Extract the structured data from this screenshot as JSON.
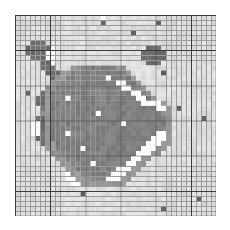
{
  "chart_data": {
    "type": "heatmap",
    "title": "",
    "subtitle": "",
    "xlabel": "",
    "ylabel": "",
    "legend": [],
    "annotations": [],
    "grid": true,
    "grid_minor_color": "#9a9a9a",
    "grid_major_color": "#3c3c3c",
    "grid_major_every": 7,
    "colormap": "gray",
    "colormap_reversed": true,
    "vmin": 0,
    "vmax": 255,
    "nrows": 40,
    "ncols": 40,
    "xlim": [
      0,
      40
    ],
    "ylim": [
      0,
      40
    ],
    "xticks": [],
    "yticks": [],
    "xticklabels": [],
    "yticklabels": [],
    "value_levels": {
      "white": 252,
      "light": 222,
      "mid_light": 196,
      "mid": 150,
      "dark": 128,
      "darker": 110,
      "very_dark": 96
    },
    "palette": [
      "#fcfcfc",
      "#dedede",
      "#c4c4c4",
      "#969696",
      "#808080",
      "#6e6e6e",
      "#606060"
    ],
    "values": [
      [
        1,
        1,
        1,
        1,
        1,
        1,
        1,
        1,
        1,
        1,
        1,
        1,
        1,
        1,
        1,
        1,
        1,
        0,
        1,
        1,
        1,
        1,
        1,
        1,
        1,
        1,
        1,
        1,
        1,
        1,
        1,
        1,
        1,
        1,
        1,
        1,
        1,
        1,
        1,
        1
      ],
      [
        1,
        1,
        1,
        1,
        1,
        1,
        1,
        1,
        1,
        1,
        1,
        1,
        1,
        1,
        1,
        1,
        1,
        6,
        1,
        1,
        1,
        1,
        1,
        1,
        1,
        1,
        1,
        1,
        6,
        1,
        1,
        1,
        1,
        1,
        1,
        1,
        1,
        1,
        1,
        1
      ],
      [
        1,
        1,
        1,
        1,
        1,
        1,
        1,
        1,
        1,
        1,
        1,
        1,
        1,
        1,
        1,
        1,
        1,
        1,
        1,
        1,
        1,
        1,
        1,
        1,
        1,
        1,
        1,
        1,
        1,
        1,
        1,
        1,
        1,
        1,
        1,
        1,
        1,
        1,
        1,
        1
      ],
      [
        1,
        1,
        1,
        1,
        1,
        1,
        1,
        1,
        1,
        1,
        1,
        1,
        1,
        1,
        1,
        1,
        1,
        1,
        1,
        1,
        1,
        1,
        1,
        6,
        1,
        1,
        1,
        1,
        1,
        1,
        1,
        1,
        1,
        1,
        1,
        1,
        1,
        1,
        1,
        1
      ],
      [
        1,
        1,
        1,
        1,
        1,
        1,
        1,
        1,
        1,
        1,
        1,
        1,
        1,
        1,
        1,
        1,
        1,
        1,
        1,
        1,
        1,
        1,
        1,
        1,
        1,
        1,
        1,
        1,
        1,
        1,
        1,
        1,
        1,
        1,
        1,
        1,
        1,
        1,
        1,
        1
      ],
      [
        1,
        1,
        1,
        5,
        5,
        5,
        1,
        1,
        1,
        1,
        1,
        1,
        1,
        1,
        1,
        1,
        1,
        1,
        1,
        1,
        1,
        1,
        1,
        1,
        1,
        1,
        1,
        1,
        1,
        1,
        1,
        1,
        1,
        1,
        1,
        1,
        1,
        1,
        1,
        1
      ],
      [
        1,
        1,
        5,
        5,
        5,
        5,
        5,
        0,
        1,
        1,
        1,
        1,
        1,
        1,
        1,
        1,
        1,
        1,
        1,
        1,
        1,
        1,
        1,
        1,
        1,
        1,
        5,
        5,
        5,
        1,
        1,
        1,
        1,
        1,
        1,
        1,
        1,
        1,
        1,
        1
      ],
      [
        1,
        1,
        5,
        5,
        5,
        5,
        0,
        0,
        1,
        1,
        1,
        1,
        1,
        1,
        1,
        1,
        1,
        1,
        1,
        1,
        1,
        1,
        1,
        1,
        1,
        5,
        5,
        5,
        5,
        5,
        1,
        1,
        1,
        1,
        1,
        1,
        1,
        1,
        1,
        1
      ],
      [
        1,
        1,
        1,
        5,
        5,
        5,
        0,
        0,
        1,
        1,
        1,
        1,
        1,
        1,
        1,
        1,
        1,
        1,
        1,
        1,
        1,
        1,
        1,
        1,
        1,
        5,
        5,
        5,
        5,
        5,
        1,
        1,
        1,
        1,
        1,
        1,
        1,
        1,
        1,
        1
      ],
      [
        1,
        1,
        1,
        1,
        1,
        5,
        5,
        0,
        1,
        1,
        1,
        1,
        1,
        1,
        1,
        1,
        1,
        1,
        1,
        1,
        1,
        1,
        1,
        1,
        1,
        1,
        5,
        5,
        5,
        1,
        1,
        1,
        1,
        1,
        1,
        1,
        1,
        1,
        1,
        1
      ],
      [
        1,
        1,
        1,
        1,
        1,
        5,
        5,
        5,
        1,
        1,
        1,
        3,
        3,
        4,
        4,
        4,
        4,
        4,
        4,
        4,
        3,
        3,
        1,
        1,
        1,
        1,
        1,
        1,
        1,
        1,
        1,
        1,
        1,
        1,
        1,
        1,
        1,
        1,
        1,
        1
      ],
      [
        1,
        1,
        1,
        1,
        1,
        1,
        5,
        5,
        5,
        3,
        3,
        4,
        4,
        4,
        4,
        4,
        4,
        4,
        4,
        4,
        4,
        4,
        3,
        1,
        1,
        1,
        1,
        1,
        1,
        6,
        1,
        1,
        1,
        1,
        1,
        1,
        1,
        1,
        1,
        1
      ],
      [
        1,
        1,
        1,
        1,
        1,
        1,
        1,
        5,
        3,
        3,
        4,
        4,
        4,
        4,
        4,
        4,
        4,
        4,
        0,
        4,
        4,
        4,
        4,
        3,
        1,
        1,
        1,
        1,
        1,
        1,
        1,
        1,
        1,
        1,
        1,
        1,
        1,
        1,
        1,
        1
      ],
      [
        1,
        1,
        1,
        1,
        1,
        1,
        1,
        3,
        3,
        4,
        4,
        4,
        4,
        4,
        4,
        4,
        4,
        4,
        4,
        4,
        0,
        0,
        4,
        4,
        3,
        1,
        1,
        1,
        1,
        1,
        1,
        1,
        1,
        1,
        1,
        1,
        1,
        1,
        1,
        1
      ],
      [
        1,
        1,
        1,
        1,
        1,
        1,
        3,
        3,
        4,
        4,
        4,
        4,
        4,
        4,
        4,
        4,
        4,
        4,
        4,
        4,
        4,
        0,
        0,
        4,
        4,
        3,
        1,
        1,
        1,
        1,
        1,
        1,
        1,
        1,
        1,
        1,
        1,
        1,
        1,
        1
      ],
      [
        1,
        1,
        6,
        1,
        1,
        5,
        3,
        4,
        4,
        4,
        4,
        4,
        4,
        4,
        4,
        4,
        4,
        4,
        4,
        4,
        4,
        4,
        4,
        0,
        0,
        4,
        3,
        1,
        1,
        1,
        1,
        1,
        1,
        1,
        1,
        1,
        1,
        1,
        1,
        1
      ],
      [
        1,
        1,
        1,
        1,
        5,
        5,
        3,
        4,
        4,
        4,
        0,
        4,
        4,
        4,
        4,
        4,
        4,
        4,
        4,
        4,
        4,
        4,
        4,
        4,
        0,
        0,
        4,
        3,
        1,
        1,
        1,
        1,
        1,
        1,
        1,
        1,
        1,
        1,
        1,
        1
      ],
      [
        1,
        1,
        1,
        1,
        5,
        5,
        3,
        4,
        4,
        4,
        4,
        4,
        4,
        4,
        4,
        4,
        4,
        4,
        4,
        4,
        4,
        4,
        4,
        4,
        4,
        0,
        0,
        0,
        0,
        3,
        1,
        1,
        1,
        1,
        1,
        1,
        1,
        1,
        1,
        1
      ],
      [
        1,
        1,
        1,
        1,
        1,
        5,
        3,
        4,
        4,
        4,
        4,
        4,
        4,
        4,
        4,
        4,
        4,
        4,
        4,
        4,
        4,
        4,
        4,
        4,
        4,
        4,
        4,
        4,
        0,
        0,
        3,
        1,
        6,
        1,
        1,
        1,
        1,
        1,
        1,
        1
      ],
      [
        1,
        1,
        1,
        1,
        1,
        3,
        3,
        4,
        4,
        4,
        4,
        4,
        4,
        4,
        4,
        4,
        0,
        4,
        4,
        4,
        4,
        4,
        4,
        4,
        4,
        4,
        4,
        4,
        4,
        3,
        3,
        1,
        1,
        1,
        1,
        1,
        1,
        1,
        1,
        1
      ],
      [
        1,
        1,
        1,
        1,
        5,
        5,
        3,
        4,
        4,
        4,
        4,
        4,
        4,
        4,
        4,
        4,
        4,
        4,
        4,
        4,
        4,
        4,
        4,
        4,
        4,
        4,
        4,
        4,
        4,
        4,
        3,
        1,
        1,
        1,
        1,
        1,
        1,
        6,
        1,
        1
      ],
      [
        1,
        1,
        1,
        0,
        0,
        5,
        3,
        4,
        4,
        4,
        4,
        4,
        4,
        4,
        4,
        4,
        4,
        4,
        4,
        4,
        4,
        0,
        4,
        4,
        4,
        4,
        4,
        4,
        4,
        4,
        3,
        1,
        1,
        1,
        1,
        1,
        1,
        1,
        1,
        1
      ],
      [
        1,
        1,
        1,
        0,
        0,
        5,
        3,
        4,
        4,
        4,
        4,
        4,
        4,
        4,
        4,
        4,
        4,
        4,
        4,
        4,
        4,
        4,
        4,
        4,
        4,
        4,
        4,
        4,
        4,
        4,
        3,
        1,
        1,
        1,
        1,
        1,
        1,
        1,
        1,
        1
      ],
      [
        1,
        1,
        1,
        0,
        0,
        5,
        3,
        4,
        4,
        4,
        0,
        4,
        4,
        4,
        4,
        4,
        4,
        4,
        4,
        4,
        4,
        4,
        4,
        4,
        4,
        4,
        4,
        4,
        0,
        0,
        3,
        1,
        1,
        1,
        1,
        1,
        1,
        1,
        1,
        1
      ],
      [
        1,
        1,
        1,
        1,
        5,
        5,
        3,
        4,
        4,
        4,
        4,
        4,
        4,
        4,
        4,
        4,
        4,
        4,
        4,
        4,
        4,
        4,
        4,
        4,
        4,
        4,
        4,
        0,
        0,
        0,
        3,
        1,
        1,
        1,
        1,
        1,
        1,
        1,
        1,
        1
      ],
      [
        1,
        1,
        1,
        1,
        1,
        5,
        3,
        3,
        4,
        4,
        4,
        4,
        4,
        4,
        4,
        4,
        4,
        4,
        4,
        4,
        4,
        4,
        4,
        4,
        4,
        4,
        0,
        0,
        0,
        3,
        3,
        1,
        1,
        1,
        1,
        1,
        1,
        1,
        1,
        1
      ],
      [
        1,
        1,
        1,
        1,
        1,
        1,
        3,
        3,
        4,
        4,
        4,
        4,
        4,
        0,
        4,
        4,
        4,
        4,
        4,
        4,
        4,
        4,
        4,
        4,
        4,
        0,
        0,
        0,
        3,
        3,
        1,
        1,
        1,
        1,
        1,
        1,
        1,
        1,
        1,
        1
      ],
      [
        1,
        1,
        1,
        1,
        1,
        1,
        1,
        3,
        3,
        4,
        4,
        4,
        4,
        4,
        4,
        4,
        4,
        4,
        4,
        4,
        4,
        4,
        4,
        4,
        0,
        0,
        0,
        3,
        3,
        1,
        1,
        1,
        1,
        1,
        1,
        1,
        1,
        1,
        1,
        1
      ],
      [
        1,
        1,
        1,
        1,
        1,
        1,
        1,
        1,
        3,
        3,
        4,
        4,
        4,
        4,
        4,
        4,
        4,
        4,
        4,
        4,
        4,
        4,
        4,
        0,
        0,
        3,
        3,
        1,
        1,
        1,
        1,
        1,
        1,
        1,
        1,
        1,
        1,
        1,
        1,
        1
      ],
      [
        1,
        1,
        1,
        1,
        1,
        1,
        1,
        1,
        1,
        3,
        3,
        4,
        4,
        4,
        4,
        0,
        4,
        4,
        4,
        4,
        4,
        4,
        0,
        0,
        3,
        3,
        1,
        1,
        1,
        1,
        1,
        1,
        1,
        1,
        1,
        1,
        1,
        1,
        1,
        1
      ],
      [
        1,
        1,
        1,
        1,
        1,
        1,
        1,
        1,
        1,
        1,
        3,
        3,
        4,
        4,
        4,
        4,
        4,
        4,
        4,
        4,
        0,
        0,
        0,
        3,
        3,
        1,
        1,
        1,
        1,
        1,
        1,
        1,
        1,
        1,
        1,
        1,
        1,
        1,
        1,
        1
      ],
      [
        1,
        1,
        1,
        1,
        1,
        1,
        1,
        1,
        1,
        1,
        0,
        3,
        3,
        4,
        4,
        4,
        4,
        4,
        4,
        0,
        0,
        0,
        3,
        3,
        1,
        1,
        1,
        1,
        1,
        1,
        1,
        1,
        1,
        1,
        1,
        1,
        1,
        1,
        1,
        1
      ],
      [
        1,
        1,
        1,
        1,
        1,
        1,
        1,
        1,
        1,
        1,
        0,
        0,
        3,
        3,
        3,
        4,
        4,
        4,
        0,
        0,
        0,
        3,
        3,
        1,
        1,
        1,
        1,
        1,
        1,
        1,
        1,
        1,
        1,
        1,
        1,
        1,
        1,
        1,
        1,
        1
      ],
      [
        1,
        1,
        1,
        1,
        1,
        1,
        1,
        1,
        1,
        1,
        1,
        0,
        0,
        3,
        3,
        3,
        3,
        3,
        3,
        3,
        3,
        3,
        1,
        1,
        1,
        1,
        1,
        1,
        1,
        1,
        1,
        1,
        1,
        1,
        1,
        1,
        1,
        1,
        1,
        1
      ],
      [
        1,
        1,
        1,
        1,
        1,
        1,
        1,
        1,
        1,
        1,
        1,
        1,
        1,
        1,
        1,
        1,
        1,
        1,
        1,
        1,
        1,
        1,
        1,
        1,
        1,
        1,
        1,
        1,
        1,
        1,
        1,
        1,
        1,
        1,
        1,
        1,
        1,
        1,
        1,
        1
      ],
      [
        1,
        1,
        1,
        1,
        1,
        1,
        1,
        1,
        1,
        1,
        1,
        1,
        1,
        6,
        1,
        1,
        1,
        1,
        1,
        1,
        1,
        1,
        1,
        1,
        1,
        1,
        1,
        1,
        1,
        1,
        1,
        1,
        1,
        1,
        1,
        1,
        1,
        1,
        1,
        1
      ],
      [
        1,
        1,
        1,
        1,
        1,
        1,
        1,
        1,
        1,
        1,
        1,
        1,
        1,
        1,
        1,
        1,
        1,
        1,
        1,
        1,
        1,
        1,
        1,
        1,
        1,
        1,
        1,
        1,
        1,
        1,
        1,
        1,
        1,
        1,
        1,
        1,
        6,
        1,
        1,
        1
      ],
      [
        1,
        1,
        1,
        1,
        1,
        1,
        1,
        1,
        1,
        1,
        1,
        1,
        1,
        1,
        1,
        1,
        1,
        1,
        1,
        1,
        1,
        1,
        1,
        1,
        1,
        1,
        1,
        1,
        1,
        1,
        1,
        1,
        1,
        1,
        1,
        1,
        1,
        1,
        1,
        1
      ],
      [
        1,
        1,
        1,
        1,
        1,
        1,
        1,
        1,
        1,
        1,
        1,
        1,
        1,
        1,
        1,
        1,
        1,
        1,
        1,
        1,
        1,
        1,
        1,
        1,
        1,
        1,
        1,
        1,
        1,
        6,
        1,
        1,
        1,
        1,
        1,
        1,
        1,
        1,
        1,
        1
      ],
      [
        1,
        1,
        1,
        1,
        1,
        1,
        1,
        1,
        1,
        1,
        1,
        1,
        1,
        1,
        1,
        1,
        1,
        1,
        1,
        1,
        1,
        1,
        1,
        1,
        1,
        1,
        1,
        1,
        1,
        1,
        1,
        1,
        1,
        1,
        1,
        1,
        1,
        1,
        1,
        1
      ]
    ]
  }
}
